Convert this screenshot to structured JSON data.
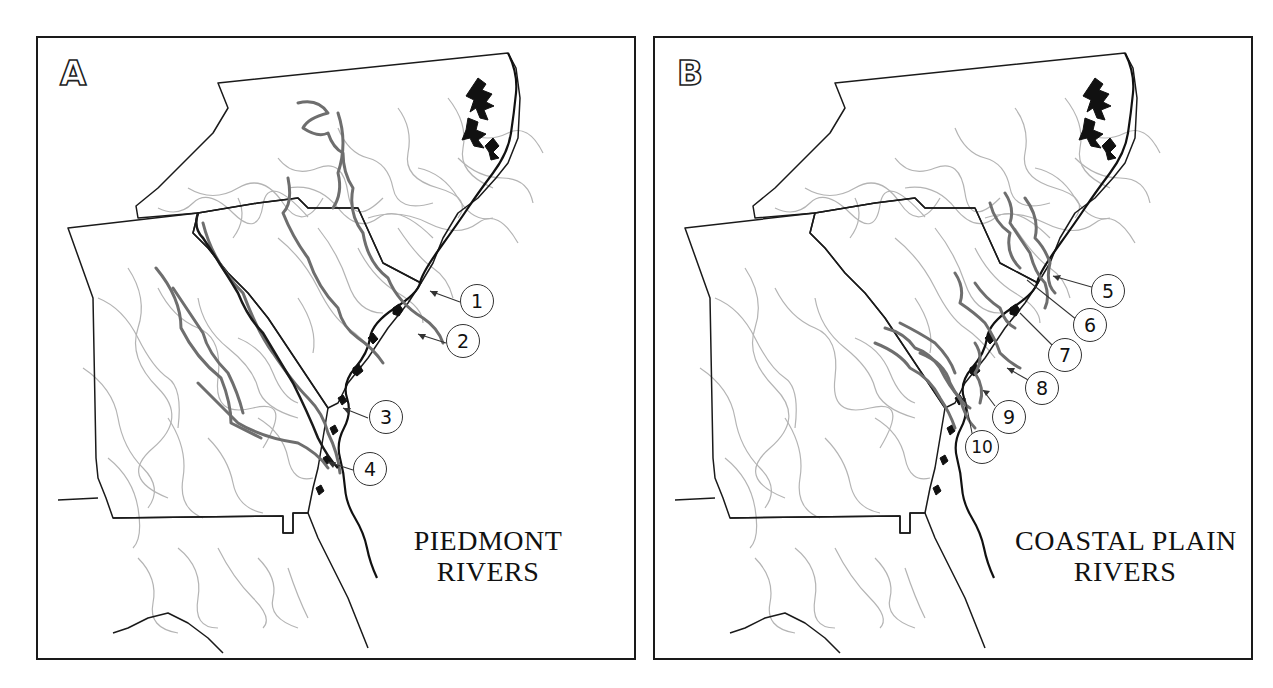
{
  "figure": {
    "panels": [
      {
        "id": "A",
        "letter": "A",
        "title_line1": "PIEDMONT",
        "title_line2": "RIVERS",
        "callouts": [
          {
            "label": "1"
          },
          {
            "label": "2"
          },
          {
            "label": "3"
          },
          {
            "label": "4"
          }
        ]
      },
      {
        "id": "B",
        "letter": "B",
        "title_line1": "COASTAL PLAIN",
        "title_line2": "RIVERS",
        "callouts": [
          {
            "label": "5"
          },
          {
            "label": "6"
          },
          {
            "label": "7"
          },
          {
            "label": "8"
          },
          {
            "label": "9"
          },
          {
            "label": "10"
          }
        ]
      }
    ],
    "colors": {
      "state_border": "#1a1a1a",
      "minor_rivers": "#b0b0b0",
      "highlighted_rivers": "#6e6e6e",
      "coastline": "#111111",
      "background": "#ffffff"
    }
  }
}
